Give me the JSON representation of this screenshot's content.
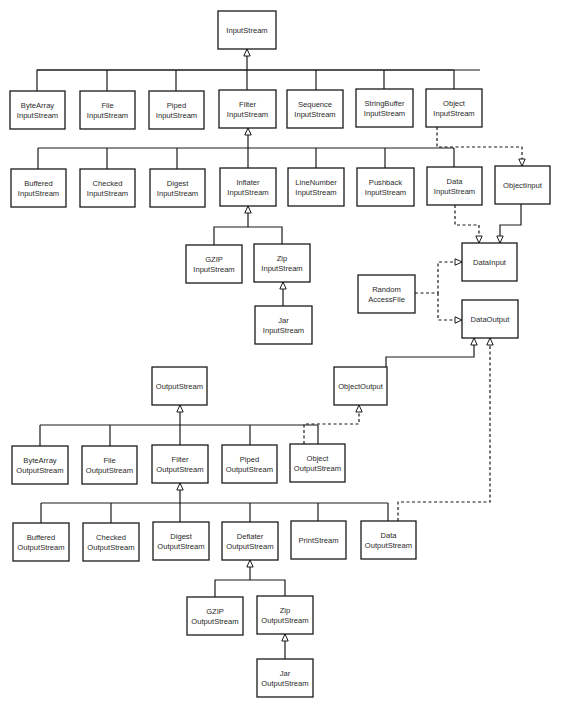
{
  "diagram": {
    "nodes": [
      {
        "id": "InputStream",
        "lines": [
          "InputStream"
        ],
        "x": 218,
        "y": 11,
        "w": 58,
        "h": 38
      },
      {
        "id": "ByteArrayInputStream",
        "lines": [
          "ByteArray",
          "InputStream"
        ],
        "x": 10,
        "y": 91,
        "w": 55,
        "h": 38
      },
      {
        "id": "FileInputStream",
        "lines": [
          "File",
          "InputStream"
        ],
        "x": 80,
        "y": 91,
        "w": 55,
        "h": 38
      },
      {
        "id": "PipedInputStream",
        "lines": [
          "Piped",
          "InputStream"
        ],
        "x": 149,
        "y": 91,
        "w": 55,
        "h": 38
      },
      {
        "id": "FilterInputStream",
        "lines": [
          "Filter",
          "InputStream"
        ],
        "x": 219,
        "y": 90,
        "w": 57,
        "h": 38
      },
      {
        "id": "SequenceInputStream",
        "lines": [
          "Sequence",
          "InputStream"
        ],
        "x": 287,
        "y": 90,
        "w": 56,
        "h": 38
      },
      {
        "id": "StringBufferInputStream",
        "lines": [
          "StringBuffer",
          "InputStream"
        ],
        "x": 356,
        "y": 89,
        "w": 57,
        "h": 38
      },
      {
        "id": "ObjectInputStream",
        "lines": [
          "Object",
          "InputStream"
        ],
        "x": 426,
        "y": 89,
        "w": 56,
        "h": 38
      },
      {
        "id": "BufferedInputStream",
        "lines": [
          "Buffered",
          "InputStream"
        ],
        "x": 11,
        "y": 169,
        "w": 55,
        "h": 38
      },
      {
        "id": "CheckedInputStream",
        "lines": [
          "Checked",
          "InputStream"
        ],
        "x": 80,
        "y": 169,
        "w": 55,
        "h": 38
      },
      {
        "id": "DigestInputStream",
        "lines": [
          "Digest",
          "InputStream"
        ],
        "x": 150,
        "y": 169,
        "w": 55,
        "h": 38
      },
      {
        "id": "InflaterInputStream",
        "lines": [
          "Inflater",
          "InputStream"
        ],
        "x": 220,
        "y": 168,
        "w": 56,
        "h": 38
      },
      {
        "id": "LineNumberInputStream",
        "lines": [
          "LineNumber",
          "InputStream"
        ],
        "x": 288,
        "y": 168,
        "w": 56,
        "h": 38
      },
      {
        "id": "PushbackInputStream",
        "lines": [
          "Pushback",
          "InputStream"
        ],
        "x": 357,
        "y": 168,
        "w": 57,
        "h": 38
      },
      {
        "id": "DataInputStream",
        "lines": [
          "Data",
          "InputStream"
        ],
        "x": 427,
        "y": 167,
        "w": 55,
        "h": 38
      },
      {
        "id": "ObjectInput",
        "lines": [
          "ObjectInput"
        ],
        "x": 495,
        "y": 166,
        "w": 55,
        "h": 38
      },
      {
        "id": "GZIPInputStream",
        "lines": [
          "GZIP",
          "InputStream"
        ],
        "x": 186,
        "y": 245,
        "w": 56,
        "h": 38
      },
      {
        "id": "ZipInputStream",
        "lines": [
          "Zip",
          "InputStream"
        ],
        "x": 254,
        "y": 244,
        "w": 56,
        "h": 38
      },
      {
        "id": "JarInputStream",
        "lines": [
          "Jar",
          "InputStream"
        ],
        "x": 255,
        "y": 306,
        "w": 57,
        "h": 38
      },
      {
        "id": "DataInput",
        "lines": [
          "DataInput"
        ],
        "x": 462,
        "y": 243,
        "w": 55,
        "h": 38
      },
      {
        "id": "RandomAccessFile",
        "lines": [
          "Random",
          "AccessFile"
        ],
        "x": 358,
        "y": 275,
        "w": 57,
        "h": 38
      },
      {
        "id": "DataOutput",
        "lines": [
          "DataOutput"
        ],
        "x": 462,
        "y": 300,
        "w": 56,
        "h": 38
      },
      {
        "id": "OutputStream",
        "lines": [
          "OutputStream"
        ],
        "x": 152,
        "y": 367,
        "w": 55,
        "h": 38
      },
      {
        "id": "ObjectOutput",
        "lines": [
          "ObjectOutput"
        ],
        "x": 334,
        "y": 367,
        "w": 53,
        "h": 38
      },
      {
        "id": "ByteArrayOutputStream",
        "lines": [
          "ByteArray",
          "OutputStream"
        ],
        "x": 12,
        "y": 446,
        "w": 56,
        "h": 38
      },
      {
        "id": "FileOutputStream",
        "lines": [
          "File",
          "OutputStream"
        ],
        "x": 82,
        "y": 446,
        "w": 55,
        "h": 38
      },
      {
        "id": "FilterOutputStream",
        "lines": [
          "Filter",
          "OutputStream"
        ],
        "x": 152,
        "y": 445,
        "w": 56,
        "h": 38
      },
      {
        "id": "PipedOutputStream",
        "lines": [
          "Piped",
          "OutputStream"
        ],
        "x": 222,
        "y": 445,
        "w": 55,
        "h": 38
      },
      {
        "id": "ObjectOutputStream",
        "lines": [
          "Object",
          "OutputStream"
        ],
        "x": 290,
        "y": 444,
        "w": 55,
        "h": 38
      },
      {
        "id": "BufferedOutputStream",
        "lines": [
          "Buffered",
          "OutputStream"
        ],
        "x": 13,
        "y": 523,
        "w": 56,
        "h": 38
      },
      {
        "id": "CheckedOutputStream",
        "lines": [
          "Checked",
          "OutputStream"
        ],
        "x": 83,
        "y": 523,
        "w": 56,
        "h": 38
      },
      {
        "id": "DigestOutputStream",
        "lines": [
          "Digest",
          "OutputStream"
        ],
        "x": 153,
        "y": 522,
        "w": 56,
        "h": 38
      },
      {
        "id": "DeflaterOutputStream",
        "lines": [
          "Deflater",
          "OutputStream"
        ],
        "x": 222,
        "y": 522,
        "w": 56,
        "h": 38
      },
      {
        "id": "PrintStream",
        "lines": [
          "PrintStream"
        ],
        "x": 291,
        "y": 521,
        "w": 55,
        "h": 38
      },
      {
        "id": "DataOutputStream",
        "lines": [
          "Data",
          "OutputStream"
        ],
        "x": 361,
        "y": 521,
        "w": 55,
        "h": 38
      },
      {
        "id": "GZIPOutputStream",
        "lines": [
          "GZIP",
          "OutputStream"
        ],
        "x": 187,
        "y": 597,
        "w": 56,
        "h": 38
      },
      {
        "id": "ZipOutputStream",
        "lines": [
          "Zip",
          "OutputStream"
        ],
        "x": 257,
        "y": 596,
        "w": 56,
        "h": 38
      },
      {
        "id": "JarOutputStream",
        "lines": [
          "Jar",
          "OutputStream"
        ],
        "x": 257,
        "y": 659,
        "w": 56,
        "h": 38
      }
    ],
    "edges": [
      {
        "name": "inputstream-subclasses",
        "style": "solid",
        "points": [
          [
            37,
            91
          ],
          [
            37,
            70
          ],
          [
            480,
            70
          ],
          [
            454,
            70
          ],
          [
            454,
            89
          ]
        ],
        "extra": [
          [
            [
              107,
              91
            ],
            [
              107,
              70
            ]
          ],
          [
            [
              176,
              91
            ],
            [
              176,
              70
            ]
          ],
          [
            [
              316,
              90
            ],
            [
              316,
              70
            ]
          ],
          [
            [
              384,
              89
            ],
            [
              384,
              70
            ]
          ],
          [
            [
              37,
              70
            ],
            [
              454,
              70
            ]
          ]
        ]
      },
      {
        "name": "filterinputstream-to-inputstream",
        "style": "solid",
        "points": [
          [
            247,
            90
          ],
          [
            247,
            49
          ]
        ],
        "arrow": [
          247,
          49
        ]
      },
      {
        "name": "filterinputstream-subclasses",
        "style": "solid",
        "points": [
          [
            38,
            148
          ],
          [
            454,
            148
          ]
        ],
        "extra": [
          [
            [
              38,
              169
            ],
            [
              38,
              148
            ]
          ],
          [
            [
              107,
              169
            ],
            [
              107,
              148
            ]
          ],
          [
            [
              177,
              169
            ],
            [
              177,
              148
            ]
          ],
          [
            [
              316,
              168
            ],
            [
              316,
              148
            ]
          ],
          [
            [
              385,
              168
            ],
            [
              385,
              148
            ]
          ],
          [
            [
              454,
              167
            ],
            [
              454,
              148
            ]
          ]
        ]
      },
      {
        "name": "inflater-to-filterinputstream",
        "style": "solid",
        "points": [
          [
            248,
            168
          ],
          [
            248,
            128
          ]
        ],
        "arrow": [
          248,
          128
        ]
      },
      {
        "name": "inflater-subclasses",
        "style": "solid",
        "points": [
          [
            214,
            245
          ],
          [
            214,
            227
          ],
          [
            282,
            227
          ],
          [
            282,
            244
          ]
        ]
      },
      {
        "name": "gzip-zip-to-inflater",
        "style": "solid",
        "points": [
          [
            248,
            227
          ],
          [
            248,
            206
          ]
        ],
        "arrow": [
          248,
          206
        ]
      },
      {
        "name": "jar-to-zip-input",
        "style": "solid",
        "points": [
          [
            283,
            306
          ],
          [
            283,
            282
          ]
        ],
        "arrow": [
          283,
          282
        ]
      },
      {
        "name": "objectinputstream-implements-objectinput",
        "style": "dashed",
        "points": [
          [
            437,
            127
          ],
          [
            437,
            147
          ],
          [
            522,
            147
          ],
          [
            522,
            166
          ]
        ],
        "arrow": [
          522,
          166
        ],
        "arrowDir": "down"
      },
      {
        "name": "datainputstream-implements-datainput",
        "style": "dashed",
        "points": [
          [
            455,
            205
          ],
          [
            455,
            225
          ],
          [
            479,
            225
          ],
          [
            479,
            243
          ]
        ],
        "arrow": [
          479,
          243
        ],
        "arrowDir": "down"
      },
      {
        "name": "objectinput-extends-datainput",
        "style": "solid",
        "points": [
          [
            521,
            204
          ],
          [
            521,
            225
          ],
          [
            500,
            225
          ],
          [
            500,
            243
          ]
        ],
        "arrow": [
          500,
          243
        ],
        "arrowDir": "down"
      },
      {
        "name": "randomaccessfile-implements-datainput",
        "style": "dashed",
        "points": [
          [
            415,
            293
          ],
          [
            438,
            293
          ],
          [
            438,
            262
          ],
          [
            462,
            262
          ]
        ],
        "arrow": [
          462,
          262
        ],
        "arrowDir": "right"
      },
      {
        "name": "randomaccessfile-implements-dataoutput",
        "style": "dashed",
        "points": [
          [
            438,
            293
          ],
          [
            438,
            320
          ],
          [
            462,
            320
          ]
        ],
        "arrow": [
          462,
          320
        ],
        "arrowDir": "right"
      },
      {
        "name": "objectoutput-extends-dataoutput",
        "style": "solid",
        "points": [
          [
            386,
            367
          ],
          [
            386,
            357
          ],
          [
            474,
            357
          ],
          [
            474,
            338
          ]
        ],
        "arrow": [
          474,
          338
        ]
      },
      {
        "name": "dataoutputstream-implements-dataoutput",
        "style": "dashed",
        "points": [
          [
            398,
            521
          ],
          [
            398,
            502
          ],
          [
            490,
            502
          ],
          [
            490,
            338
          ]
        ],
        "arrow": [
          490,
          338
        ]
      },
      {
        "name": "outputstream-subclasses",
        "style": "solid",
        "points": [
          [
            40,
            425
          ],
          [
            318,
            425
          ]
        ],
        "extra": [
          [
            [
              40,
              446
            ],
            [
              40,
              425
            ]
          ],
          [
            [
              110,
              446
            ],
            [
              110,
              425
            ]
          ],
          [
            [
              250,
              445
            ],
            [
              250,
              425
            ]
          ],
          [
            [
              318,
              444
            ],
            [
              318,
              425
            ]
          ]
        ]
      },
      {
        "name": "filteroutputstream-to-outputstream",
        "style": "solid",
        "points": [
          [
            180,
            445
          ],
          [
            180,
            405
          ]
        ],
        "arrow": [
          180,
          405
        ]
      },
      {
        "name": "objectoutputstream-implements-objectoutput",
        "style": "dashed",
        "points": [
          [
            304,
            444
          ],
          [
            304,
            424
          ],
          [
            359,
            424
          ],
          [
            359,
            405
          ]
        ],
        "arrow": [
          359,
          405
        ]
      },
      {
        "name": "filteroutputstream-subclasses",
        "style": "solid",
        "points": [
          [
            41,
            503
          ],
          [
            388,
            503
          ]
        ],
        "extra": [
          [
            [
              41,
              523
            ],
            [
              41,
              503
            ]
          ],
          [
            [
              111,
              523
            ],
            [
              111,
              503
            ]
          ],
          [
            [
              250,
              522
            ],
            [
              250,
              503
            ]
          ],
          [
            [
              318,
              521
            ],
            [
              318,
              503
            ]
          ],
          [
            [
              388,
              521
            ],
            [
              388,
              503
            ]
          ]
        ]
      },
      {
        "name": "digest-etc-to-filteroutputstream",
        "style": "solid",
        "points": [
          [
            180,
            522
          ],
          [
            180,
            483
          ]
        ],
        "arrow": [
          180,
          483
        ]
      },
      {
        "name": "deflater-subclasses",
        "style": "solid",
        "points": [
          [
            215,
            597
          ],
          [
            215,
            580
          ],
          [
            285,
            580
          ],
          [
            285,
            596
          ]
        ]
      },
      {
        "name": "gzip-zip-to-deflater",
        "style": "solid",
        "points": [
          [
            250,
            580
          ],
          [
            250,
            560
          ]
        ],
        "arrow": [
          250,
          560
        ]
      },
      {
        "name": "jar-to-zip-output",
        "style": "solid",
        "points": [
          [
            285,
            659
          ],
          [
            285,
            634
          ]
        ],
        "arrow": [
          285,
          634
        ]
      }
    ]
  }
}
